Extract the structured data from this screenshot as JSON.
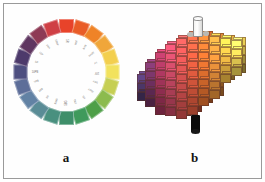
{
  "figure": {
    "panels": [
      {
        "id": "a",
        "caption": "a",
        "name": "munsell-hue-circle"
      },
      {
        "id": "b",
        "caption": "b",
        "name": "munsell-color-solid"
      }
    ],
    "frame_color": "#9a9a9a",
    "background": "#ffffff"
  },
  "hue_circle": {
    "chip_count": 20,
    "label_color": "#6d6a66",
    "chips": [
      {
        "hue": "5R",
        "color": "#e8432a",
        "angle": 0
      },
      {
        "hue": "10R",
        "color": "#e95c27",
        "angle": 18
      },
      {
        "hue": "5YR",
        "color": "#ef8327",
        "angle": 36
      },
      {
        "hue": "10YR",
        "color": "#f0a63a",
        "angle": 54
      },
      {
        "hue": "5Y",
        "color": "#f3cf4e",
        "angle": 72
      },
      {
        "hue": "10Y",
        "color": "#f2e25d",
        "angle": 90
      },
      {
        "hue": "5GY",
        "color": "#c6cf53",
        "angle": 108
      },
      {
        "hue": "10GY",
        "color": "#8cbb4e",
        "angle": 126
      },
      {
        "hue": "5G",
        "color": "#4e9f48",
        "angle": 144
      },
      {
        "hue": "10G",
        "color": "#3f9a5c",
        "angle": 162
      },
      {
        "hue": "5BG",
        "color": "#3f8f6a",
        "angle": 180
      },
      {
        "hue": "10BG",
        "color": "#49907f",
        "angle": 198
      },
      {
        "hue": "5B",
        "color": "#5a8c96",
        "angle": 216
      },
      {
        "hue": "10B",
        "color": "#6282a4",
        "angle": 234
      },
      {
        "hue": "5PB",
        "color": "#5d6e99",
        "angle": 252
      },
      {
        "hue": "10PB",
        "color": "#4e4f80",
        "angle": 270
      },
      {
        "hue": "5P",
        "color": "#4d3a6b",
        "angle": 288
      },
      {
        "hue": "10P",
        "color": "#5f3660",
        "angle": 306
      },
      {
        "hue": "5RP",
        "color": "#8e3a55",
        "angle": 324
      },
      {
        "hue": "10RP",
        "color": "#cf3f45",
        "angle": 342
      }
    ]
  },
  "color_solid": {
    "axis": {
      "top_label": "white-neutral-axis",
      "bottom_label": "black-neutral-axis",
      "top_color": "#fafafa",
      "bottom_color": "#0b0b0b",
      "knob_color": "#b9b9b4"
    },
    "description": "three-dimensional munsell color tree of stacked chips",
    "columns": [
      {
        "hue": "5P",
        "x": 4,
        "base_color": "#4a3566",
        "chips": 3,
        "top": 62
      },
      {
        "hue": "10P",
        "x": 12,
        "base_color": "#6b2f5d",
        "chips": 5,
        "top": 50
      },
      {
        "hue": "5RP",
        "x": 22,
        "base_color": "#9c3257",
        "chips": 7,
        "top": 40
      },
      {
        "hue": "10RP",
        "x": 32,
        "base_color": "#bf4560",
        "chips": 8,
        "top": 32
      },
      {
        "hue": "5R",
        "x": 43,
        "base_color": "#d2504f",
        "chips": 9,
        "top": 26
      },
      {
        "hue": "10R",
        "x": 54,
        "base_color": "#de5a3e",
        "chips": 9,
        "top": 22
      },
      {
        "hue": "5YR",
        "x": 65,
        "base_color": "#e4712f",
        "chips": 8,
        "top": 22
      },
      {
        "hue": "10YR",
        "x": 76,
        "base_color": "#e8913a",
        "chips": 7,
        "top": 24
      },
      {
        "hue": "5Y",
        "x": 87,
        "base_color": "#eeb944",
        "chips": 5,
        "top": 26
      },
      {
        "hue": "10Y",
        "x": 98,
        "base_color": "#efd456",
        "chips": 4,
        "top": 28
      }
    ]
  }
}
